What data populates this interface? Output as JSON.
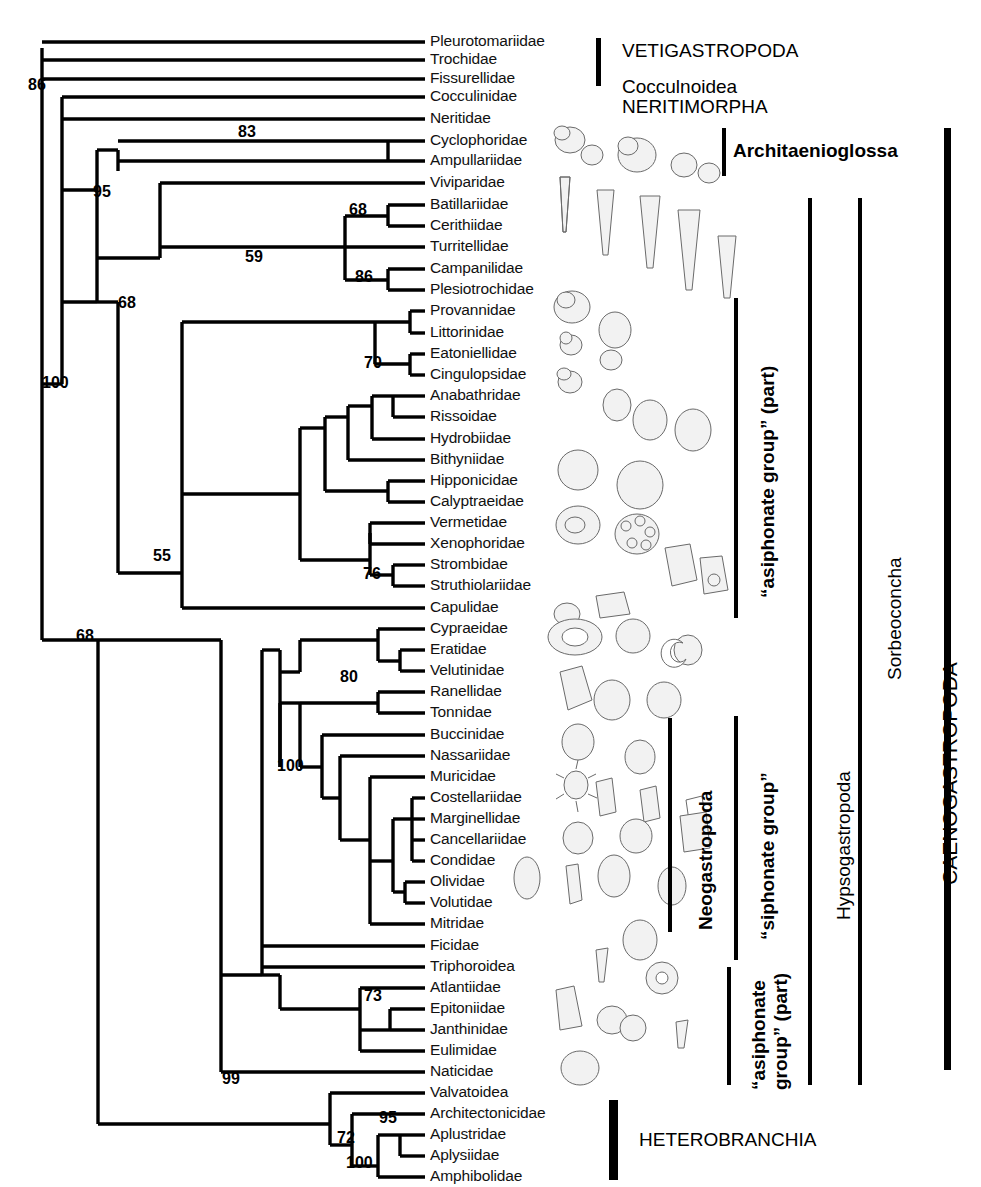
{
  "figure": {
    "type": "phylogenetic-tree",
    "tip_label_x": 430,
    "first_tip_y": 42,
    "tip_spacing": 21.48
  },
  "taxa": [
    {
      "name": "Pleurotomariidae",
      "y": 42
    },
    {
      "name": "Trochidae",
      "y": 60
    },
    {
      "name": "Fissurellidae",
      "y": 79
    },
    {
      "name": "Cocculinidae",
      "y": 97
    },
    {
      "name": "Neritidae",
      "y": 119
    },
    {
      "name": "Cyclophoridae",
      "y": 141
    },
    {
      "name": "Ampullariidae",
      "y": 161
    },
    {
      "name": "Viviparidae",
      "y": 183
    },
    {
      "name": "Batillariidae",
      "y": 205
    },
    {
      "name": "Cerithiidae",
      "y": 226
    },
    {
      "name": "Turritellidae",
      "y": 247
    },
    {
      "name": "Campanilidae",
      "y": 269
    },
    {
      "name": "Plesiotrochidae",
      "y": 290
    },
    {
      "name": "Provannidae",
      "y": 311
    },
    {
      "name": "Littorinidae",
      "y": 333
    },
    {
      "name": "Eatoniellidae",
      "y": 354
    },
    {
      "name": "Cingulopsidae",
      "y": 375
    },
    {
      "name": "Anabathridae",
      "y": 396
    },
    {
      "name": "Rissoidae",
      "y": 417
    },
    {
      "name": "Hydrobiidae",
      "y": 439
    },
    {
      "name": "Bithyniidae",
      "y": 460
    },
    {
      "name": "Hipponicidae",
      "y": 481
    },
    {
      "name": "Calyptraeidae",
      "y": 502
    },
    {
      "name": "Vermetidae",
      "y": 523
    },
    {
      "name": "Xenophoridae",
      "y": 544
    },
    {
      "name": "Strombidae",
      "y": 565
    },
    {
      "name": "Struthiolariidae",
      "y": 586
    },
    {
      "name": "Capulidae",
      "y": 608
    },
    {
      "name": "Cypraeidae",
      "y": 629
    },
    {
      "name": "Eratidae",
      "y": 650
    },
    {
      "name": "Velutinidae",
      "y": 671
    },
    {
      "name": "Ranellidae",
      "y": 692
    },
    {
      "name": "Tonnidae",
      "y": 713
    },
    {
      "name": "Buccinidae",
      "y": 735
    },
    {
      "name": "Nassariidae",
      "y": 756
    },
    {
      "name": "Muricidae",
      "y": 777
    },
    {
      "name": "Costellariidae",
      "y": 798
    },
    {
      "name": "Marginellidae",
      "y": 819
    },
    {
      "name": "Cancellariidae",
      "y": 840
    },
    {
      "name": "Condidae",
      "y": 861
    },
    {
      "name": "Olividae",
      "y": 882
    },
    {
      "name": "Volutidae",
      "y": 903
    },
    {
      "name": "Mitridae",
      "y": 924
    },
    {
      "name": "Ficidae",
      "y": 946
    },
    {
      "name": "Triphoroidea",
      "y": 967
    },
    {
      "name": "Atlantiidae",
      "y": 988
    },
    {
      "name": "Epitoniidae",
      "y": 1009
    },
    {
      "name": "Janthinidae",
      "y": 1030
    },
    {
      "name": "Eulimidae",
      "y": 1051
    },
    {
      "name": "Naticidae",
      "y": 1072
    },
    {
      "name": "Valvatoidea",
      "y": 1093
    },
    {
      "name": "Architectonicidae",
      "y": 1114
    },
    {
      "name": "Aplustridae",
      "y": 1135
    },
    {
      "name": "Aplysiidae",
      "y": 1156
    },
    {
      "name": "Amphibolidae",
      "y": 1177
    }
  ],
  "bootstrap_values": [
    {
      "value": "86",
      "x": 28,
      "y": 86
    },
    {
      "value": "83",
      "x": 238,
      "y": 133
    },
    {
      "value": "95",
      "x": 93,
      "y": 193
    },
    {
      "value": "68",
      "x": 118,
      "y": 304
    },
    {
      "value": "59",
      "x": 245,
      "y": 258
    },
    {
      "value": "68",
      "x": 349,
      "y": 211
    },
    {
      "value": "86",
      "x": 355,
      "y": 278
    },
    {
      "value": "70",
      "x": 364,
      "y": 364
    },
    {
      "value": "100",
      "x": 42,
      "y": 384
    },
    {
      "value": "55",
      "x": 153,
      "y": 557
    },
    {
      "value": "76",
      "x": 363,
      "y": 575
    },
    {
      "value": "68",
      "x": 76,
      "y": 637
    },
    {
      "value": "80",
      "x": 340,
      "y": 678
    },
    {
      "value": "100",
      "x": 277,
      "y": 767
    },
    {
      "value": "73",
      "x": 364,
      "y": 997
    },
    {
      "value": "99",
      "x": 222,
      "y": 1080
    },
    {
      "value": "72",
      "x": 337,
      "y": 1139
    },
    {
      "value": "95",
      "x": 379,
      "y": 1119
    },
    {
      "value": "100",
      "x": 346,
      "y": 1164
    }
  ],
  "clade_labels": [
    {
      "id": "vetigastropoda",
      "text": "VETIGASTROPODA",
      "style": "plain",
      "x": 622,
      "y": 52
    },
    {
      "id": "cocculinoidea",
      "text": "Cocculnoidea",
      "style": "plain",
      "x": 622,
      "y": 88
    },
    {
      "id": "neritimorpha",
      "text": "NERITIMORPHA",
      "style": "plain",
      "x": 622,
      "y": 108
    },
    {
      "id": "architaenioglossa",
      "text": "Architaenioglossa",
      "style": "bold",
      "x": 733,
      "y": 152
    },
    {
      "id": "heterobranchia",
      "text": "HETEROBRANCHIA",
      "style": "plain",
      "x": 639,
      "y": 1141
    }
  ],
  "rotated_labels": [
    {
      "id": "asiphonate-group-part-upper",
      "text": "“asiphonate group” (part)",
      "size": 19,
      "bold": true,
      "x": 757,
      "y": 598,
      "bar_x": 734,
      "bar_y1": 298,
      "bar_y2": 618
    },
    {
      "id": "siphonate-group",
      "text": "“siphonate group”",
      "size": 19,
      "bold": true,
      "x": 757,
      "y": 940,
      "bar_x": 734,
      "bar_y1": 716,
      "bar_y2": 960
    },
    {
      "id": "asiphonate-group-part-lower",
      "text": "“asiphonate group” (part)",
      "size": 19,
      "bold": true,
      "x": 748,
      "y": 1090,
      "bar_x": 727,
      "bar_y1": 967,
      "bar_y2": 1085,
      "wrap": true
    },
    {
      "id": "neogastropoda",
      "text": "Neogastropoda",
      "size": 19,
      "bold": true,
      "x": 695,
      "y": 930,
      "bar_x": 668,
      "bar_y1": 718,
      "bar_y2": 932
    },
    {
      "id": "hypsogastropoda",
      "text": "Hypsogastropoda",
      "size": 19,
      "bold": false,
      "x": 833,
      "y": 920,
      "bar_x": 808,
      "bar_y1": 198,
      "bar_y2": 1085
    },
    {
      "id": "sorbeoconcha",
      "text": "Sorbeoconcha",
      "size": 19,
      "bold": false,
      "x": 884,
      "y": 680,
      "bar_x": 858,
      "bar_y1": 198,
      "bar_y2": 1085
    },
    {
      "id": "caenogastropoda",
      "text": "CAENOGASTROPODA",
      "size": 21,
      "bold": false,
      "x": 938,
      "y": 885,
      "bar_x": 944,
      "bar_y1": 128,
      "bar_y2": 1070
    }
  ],
  "group_bars": [
    {
      "id": "vetigastropoda-bar",
      "x": 596,
      "y": 38,
      "w": 5,
      "h": 48
    },
    {
      "id": "architaenioglossa-bar",
      "x": 722,
      "y": 128,
      "w": 4,
      "h": 48
    },
    {
      "id": "caenogastropoda-bar",
      "x": 944,
      "y": 128,
      "w": 7,
      "h": 942
    },
    {
      "id": "heterobranchia-bar",
      "x": 609,
      "y": 1100,
      "w": 9,
      "h": 80
    },
    {
      "id": "neogastropoda-bar",
      "x": 668,
      "y": 718,
      "w": 4,
      "h": 214
    },
    {
      "id": "asiphonate-upper-bar",
      "x": 734,
      "y": 298,
      "w": 4,
      "h": 320
    },
    {
      "id": "siphonate-bar",
      "x": 734,
      "y": 716,
      "w": 4,
      "h": 244
    },
    {
      "id": "asiphonate-lower-bar",
      "x": 727,
      "y": 967,
      "w": 4,
      "h": 118
    },
    {
      "id": "hypsogastropoda-bar",
      "x": 808,
      "y": 198,
      "w": 4,
      "h": 887
    },
    {
      "id": "sorbeoconcha-bar",
      "x": 858,
      "y": 198,
      "w": 4,
      "h": 887
    }
  ],
  "chart_data": {
    "type": "tree",
    "n_terminals": 55,
    "tree_newick": "((Pleurotomariidae,Trochidae,Fissurellidae)86,((Cocculinidae,Neritidae),(((Cyclophoridae,Ampullariidae)83,(Viviparidae,(((Batillariidae,Cerithiidae)68,Turritellidae),(Campanilidae,Plesiotrochidae)86)59)95,(((Provannidae,Littorinidae),(Eatoniellidae,Cingulopsidae)70),((((Anabathridae,Rissoidae),Hydrobiidae),Bithyniidae),(Hipponicidae,Calyptraeidae)),((Vermetidae,Xenophoridae),(Strombidae,Struthiolariidae)76),Capulidae)55)68,(((Cypraeidae,(Eratidae,Velutinidae)),((Ranellidae,Tonnidae)80,(Buccinidae,(Nassariidae,(Muricidae,(((Costellariidae,Marginellidae),(Cancellariidae,Condidae)),(Olividae,Volutidae)),Mitridae))))100),Ficidae,Triphoroidea,(Atlantiidae,((Epitoniidae,Janthinidae),Eulimidae))73,Naticidae)68)100,(Valvatoidea,(Architectonicidae,((Aplustridae,Aplysiidae)95,Amphibolidae)100)72)99))"
  }
}
